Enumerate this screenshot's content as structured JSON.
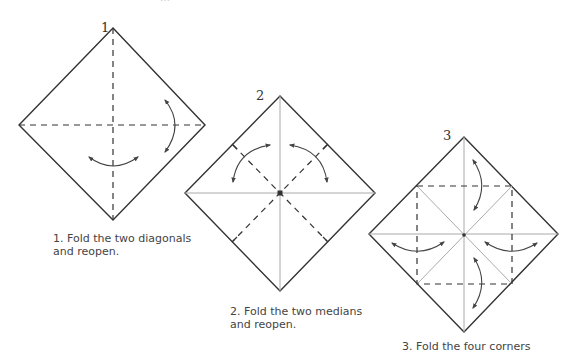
{
  "header": {
    "cut_text": "…"
  },
  "steps": [
    {
      "number": "1",
      "caption_line1": "1. Fold the two diagonals",
      "caption_line2": "and reopen."
    },
    {
      "number": "2",
      "caption_line1": "2. Fold the two medians",
      "caption_line2": "and reopen."
    },
    {
      "number": "3",
      "caption_line1": "3. Fold the four corners",
      "caption_line2": ""
    }
  ],
  "colors": {
    "outline": "#333333",
    "crease": "#aaaaaa",
    "dash": "#333333",
    "text": "#444444"
  }
}
